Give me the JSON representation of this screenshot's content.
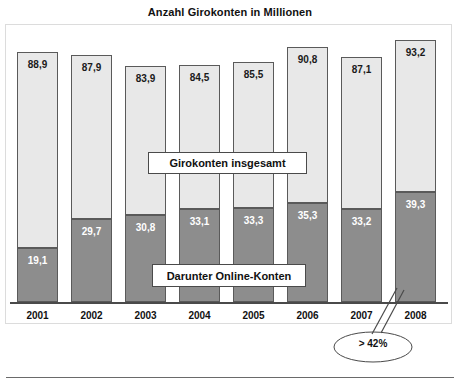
{
  "chart_data": {
    "type": "bar",
    "subtype": "stacked-vertical",
    "title": "Anzahl Girokonten in Millionen",
    "xlabel": "",
    "ylabel": "",
    "ylim": [
      0,
      100
    ],
    "grid": false,
    "legend_position": "inside-plot",
    "categories": [
      "2001",
      "2002",
      "2003",
      "2004",
      "2005",
      "2006",
      "2007",
      "2008"
    ],
    "series": [
      {
        "name": "Girokonten insgesamt",
        "color": "#e8e8e8",
        "note": "Gesamthöhe der Säule (Totalwert)",
        "values": [
          88.9,
          87.9,
          83.9,
          84.5,
          85.5,
          90.8,
          87.1,
          93.2
        ],
        "labels": [
          "88,9",
          "87,9",
          "83,9",
          "84,5",
          "85,5",
          "90,8",
          "87,1",
          "93,2"
        ]
      },
      {
        "name": "Darunter Online-Konten",
        "color": "#8d8d8d",
        "note": "Unterer, dunkler Teil der Säule",
        "values": [
          19.1,
          29.7,
          30.8,
          33.1,
          33.3,
          35.3,
          33.2,
          39.3
        ],
        "labels": [
          "19,1",
          "29,7",
          "30,8",
          "33,1",
          "33,3",
          "35,3",
          "33,2",
          "39,3"
        ]
      }
    ],
    "annotations": [
      {
        "text": "> 42%",
        "shape": "ellipse",
        "points_to": "2008 Online-Konten Anteil"
      }
    ]
  },
  "labels": {
    "callout_total": "Girokonten insgesamt",
    "callout_online": "Darunter Online-Konten",
    "annotation_value": "> 42%"
  }
}
